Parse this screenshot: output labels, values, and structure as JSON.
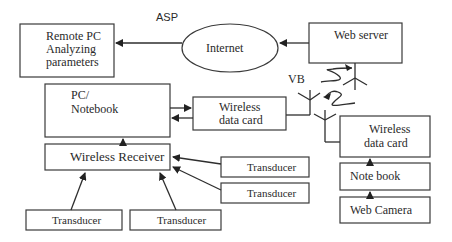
{
  "diagram": {
    "labels": {
      "asp": "ASP",
      "vb": "VB"
    },
    "nodes": {
      "remote_pc": {
        "line1": "Remote PC",
        "line2": "Analyzing",
        "line3": "parameters"
      },
      "internet": {
        "label": "Internet"
      },
      "web_server": {
        "label": "Web server"
      },
      "pc_notebook": {
        "line1": "PC/",
        "line2": "Notebook"
      },
      "wireless_card_left": {
        "line1": "Wireless",
        "line2": "data card"
      },
      "wireless_receiver": {
        "label": "Wireless Receiver"
      },
      "transducer_r1": {
        "label": "Transducer"
      },
      "transducer_r2": {
        "label": "Transducer"
      },
      "transducer_b1": {
        "label": "Transducer"
      },
      "transducer_b2": {
        "label": "Transducer"
      },
      "wireless_card_right": {
        "line1": "Wireless",
        "line2": "data card"
      },
      "notebook": {
        "label": "Note  book"
      },
      "web_camera": {
        "label": "Web Camera"
      }
    },
    "edges": [
      {
        "from": "internet",
        "to": "remote_pc"
      },
      {
        "from": "web_server",
        "to": "internet"
      },
      {
        "from": "pc_notebook",
        "to": "wireless_card_left"
      },
      {
        "from": "wireless_card_left",
        "to": "pc_notebook"
      },
      {
        "from": "wireless_receiver",
        "to": "pc_notebook"
      },
      {
        "from": "transducer_r1",
        "to": "wireless_receiver"
      },
      {
        "from": "transducer_r2",
        "to": "wireless_receiver"
      },
      {
        "from": "transducer_b1",
        "to": "wireless_receiver"
      },
      {
        "from": "transducer_b2",
        "to": "wireless_receiver"
      },
      {
        "from": "notebook",
        "to": "wireless_card_right"
      },
      {
        "from": "web_camera",
        "to": "notebook"
      },
      {
        "from": "wireless_card_left",
        "to": "web_server",
        "type": "wireless"
      },
      {
        "from": "wireless_card_right",
        "to": "wireless_card_left",
        "type": "wireless"
      }
    ]
  }
}
